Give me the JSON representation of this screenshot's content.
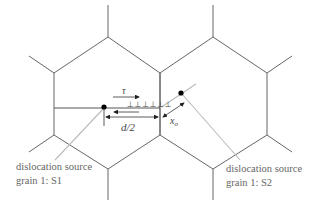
{
  "diagram": {
    "type": "grain boundary dislocation pile-up schematic",
    "grains": [
      "grain 1",
      "grain 2"
    ],
    "labels": {
      "shear_stress": "τ",
      "half_grain": "d/2",
      "distance": "x",
      "distance_sub": "o",
      "dislocations": "⊥⊥⊥⊥⊥⊥",
      "source1_line1": "dislocation source",
      "source1_line2": "grain 1: S1",
      "source2_line1": "dislocation source",
      "source2_line2": "grain 1: S2"
    },
    "colors": {
      "grain_boundary": "#555555",
      "leader_line": "#bbbbbb",
      "text": "#666666",
      "source_dot": "#000000"
    }
  }
}
